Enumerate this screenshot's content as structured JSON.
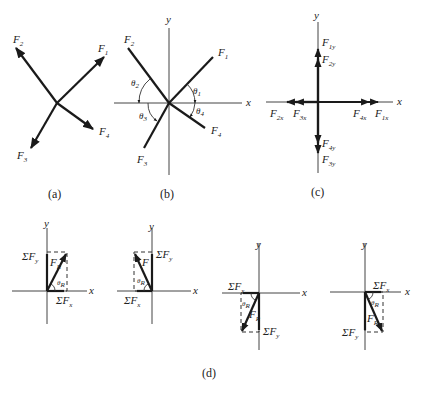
{
  "panels": {
    "a": {
      "caption": "(a)",
      "vectors": [
        {
          "name": "F1",
          "label": "F",
          "sub": "1"
        },
        {
          "name": "F2",
          "label": "F",
          "sub": "2"
        },
        {
          "name": "F3",
          "label": "F",
          "sub": "3"
        },
        {
          "name": "F4",
          "label": "F",
          "sub": "4"
        }
      ]
    },
    "b": {
      "caption": "(b)",
      "axes": {
        "x": "x",
        "y": "y"
      },
      "vectors": [
        {
          "name": "F1",
          "label": "F",
          "sub": "1"
        },
        {
          "name": "F2",
          "label": "F",
          "sub": "2"
        },
        {
          "name": "F3",
          "label": "F",
          "sub": "3"
        },
        {
          "name": "F4",
          "label": "F",
          "sub": "4"
        }
      ],
      "angles": [
        {
          "label": "θ",
          "sub": "1"
        },
        {
          "label": "θ",
          "sub": "2"
        },
        {
          "label": "θ",
          "sub": "3"
        },
        {
          "label": "θ",
          "sub": "4"
        }
      ]
    },
    "c": {
      "caption": "(c)",
      "axes": {
        "x": "x",
        "y": "y"
      },
      "components": [
        {
          "label": "F",
          "sub": "1y"
        },
        {
          "label": "F",
          "sub": "2y"
        },
        {
          "label": "F",
          "sub": "2x"
        },
        {
          "label": "F",
          "sub": "3x"
        },
        {
          "label": "F",
          "sub": "4x"
        },
        {
          "label": "F",
          "sub": "1x"
        },
        {
          "label": "F",
          "sub": "4y"
        },
        {
          "label": "F",
          "sub": "3y"
        }
      ]
    },
    "d": {
      "caption": "(d)",
      "sum_x": "ΣF",
      "sum_x_sub": "x",
      "sum_y": "ΣF",
      "sum_y_sub": "y",
      "resultant": "F",
      "resultant_sub": "R",
      "angle": "θ",
      "angle_sub": "R",
      "axes": {
        "x": "x",
        "y": "y"
      }
    }
  }
}
